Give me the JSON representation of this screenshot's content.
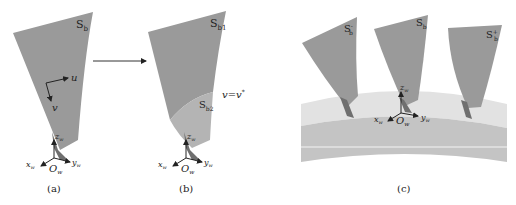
{
  "figure": {
    "panels": [
      {
        "id": "a",
        "caption": "(a)",
        "surface_label": "S",
        "surface_sub": "b",
        "axes": {
          "u": "u",
          "v": "v"
        },
        "frame": {
          "origin": "O",
          "origin_sub": "w",
          "x": "x",
          "x_sub": "w",
          "y": "y",
          "y_sub": "w",
          "z": "z",
          "z_sub": "w"
        }
      },
      {
        "id": "b",
        "caption": "(b)",
        "surface_upper_label": "S",
        "surface_upper_sub": "b1",
        "surface_lower_label": "S",
        "surface_lower_sub": "b2",
        "boundary_label": "v=v",
        "boundary_sup": "*",
        "frame": {
          "origin": "O",
          "origin_sub": "w",
          "x": "x",
          "x_sub": "w",
          "y": "y",
          "y_sub": "w",
          "z": "z",
          "z_sub": "w"
        }
      },
      {
        "id": "c",
        "caption": "(c)",
        "blades": [
          {
            "label": "S",
            "sub": "b",
            "sup": "-"
          },
          {
            "label": "S",
            "sub": "b",
            "sup": ""
          },
          {
            "label": "S",
            "sub": "b",
            "sup": "+"
          }
        ],
        "frame": {
          "origin": "O",
          "origin_sub": "w",
          "x": "x",
          "x_sub": "w",
          "y": "y",
          "y_sub": "w",
          "z": "z",
          "z_sub": "w"
        }
      }
    ],
    "colors": {
      "blade": "#9a9a9a",
      "blade_dark": "#6f6f6f",
      "blade_lower": "#b4b4b4",
      "hub_light": "#e2e2e2",
      "hub_mid": "#c4c4c4",
      "hub_line": "#f4f4f4",
      "ink": "#222222"
    }
  }
}
